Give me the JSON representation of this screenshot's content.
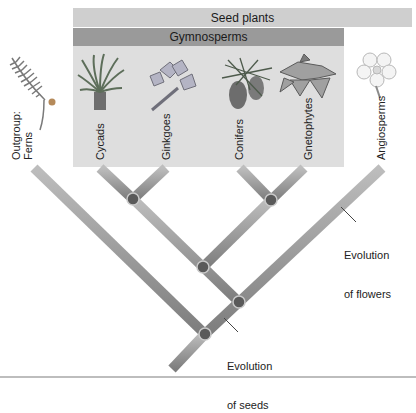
{
  "header": {
    "seed_plants": "Seed plants",
    "gymnosperms": "Gymnosperms"
  },
  "taxa": [
    {
      "label": "Outgroup:\nFerns",
      "line1": "Outgroup:",
      "line2": "Ferns",
      "icon": "fern-icon"
    },
    {
      "label": "Cycads",
      "icon": "cycad-icon"
    },
    {
      "label": "Ginkgoes",
      "icon": "ginkgo-icon"
    },
    {
      "label": "Conifers",
      "icon": "conifer-cone-icon"
    },
    {
      "label": "Gnetophytes",
      "icon": "gnetophyte-icon"
    },
    {
      "label": "Angiosperms",
      "icon": "flower-icon"
    }
  ],
  "annotations": {
    "flowers": {
      "line1": "Evolution",
      "line2": "of flowers"
    },
    "seeds": {
      "line1": "Evolution",
      "line2": "of seeds"
    }
  },
  "colors": {
    "seed_bar": "#cfcfcf",
    "gymno_bar": "#9a9a9a",
    "gymno_panel": "#dedede",
    "branch": "#8c8c8c",
    "node": "#5a5a5a"
  }
}
